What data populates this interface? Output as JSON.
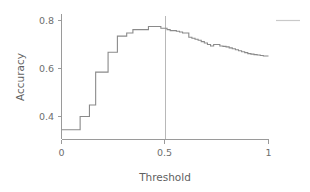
{
  "chart_data": {
    "type": "line",
    "title": "",
    "subtitle": "",
    "xlabel": "Threshold",
    "ylabel": "Accuracy",
    "xlim": [
      0,
      1
    ],
    "ylim": [
      0.3,
      0.83
    ],
    "xticks": [
      0,
      0.5,
      1
    ],
    "xticklabels": [
      "0",
      "0.5",
      "1"
    ],
    "yticks": [
      0.4,
      0.6,
      0.8
    ],
    "yticklabels": [
      "0.4",
      "0.6",
      "0.8"
    ],
    "grid": false,
    "legend_position": "top-right",
    "drawstyle": "steps-post",
    "series": [
      {
        "name": "accuracy",
        "color": "#8a8a8a",
        "x": [
          0.0,
          0.02,
          0.04,
          0.06,
          0.075,
          0.09,
          0.105,
          0.12,
          0.135,
          0.15,
          0.165,
          0.18,
          0.195,
          0.21,
          0.225,
          0.24,
          0.255,
          0.27,
          0.285,
          0.3,
          0.315,
          0.33,
          0.345,
          0.36,
          0.375,
          0.39,
          0.405,
          0.42,
          0.435,
          0.45,
          0.465,
          0.48,
          0.495,
          0.51,
          0.525,
          0.54,
          0.555,
          0.57,
          0.585,
          0.6,
          0.615,
          0.63,
          0.645,
          0.66,
          0.675,
          0.69,
          0.705,
          0.72,
          0.735,
          0.75,
          0.765,
          0.78,
          0.795,
          0.81,
          0.825,
          0.84,
          0.855,
          0.87,
          0.885,
          0.9,
          0.915,
          0.93,
          0.945,
          0.96,
          0.975,
          1.0
        ],
        "y": [
          0.345,
          0.345,
          0.345,
          0.345,
          0.345,
          0.4,
          0.4,
          0.4,
          0.448,
          0.448,
          0.585,
          0.585,
          0.585,
          0.585,
          0.668,
          0.668,
          0.668,
          0.735,
          0.735,
          0.735,
          0.748,
          0.748,
          0.762,
          0.762,
          0.762,
          0.762,
          0.762,
          0.775,
          0.775,
          0.775,
          0.775,
          0.768,
          0.768,
          0.762,
          0.758,
          0.758,
          0.755,
          0.752,
          0.748,
          0.748,
          0.73,
          0.726,
          0.722,
          0.718,
          0.712,
          0.706,
          0.7,
          0.694,
          0.7,
          0.7,
          0.694,
          0.692,
          0.69,
          0.686,
          0.682,
          0.678,
          0.674,
          0.67,
          0.666,
          0.662,
          0.66,
          0.658,
          0.656,
          0.654,
          0.652,
          0.652
        ]
      }
    ],
    "reference_lines": [
      {
        "name": "threshold-marker",
        "orientation": "vertical",
        "value": 0.5,
        "color": "#b8b8b8"
      }
    ],
    "legend": [
      {
        "label": "",
        "color": "#c9c9c9"
      }
    ]
  },
  "axes": {
    "y_label": "Accuracy",
    "x_label": "Threshold",
    "y_tick_labels": [
      "0.8",
      "0.6",
      "0.4"
    ],
    "x_tick_labels": [
      "0",
      "0.5",
      "1"
    ]
  },
  "colors": {
    "line": "#8a8a8a",
    "axis": "#9a9a9a",
    "reference": "#b8b8b8",
    "legend_swatch": "#c9c9c9",
    "text": "#6e6e6e",
    "background": "#ffffff"
  }
}
